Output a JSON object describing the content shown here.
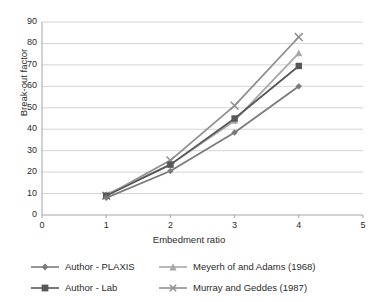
{
  "chart_data": {
    "type": "line",
    "title": "",
    "xlabel": "Embedment ratio",
    "ylabel": "Break-out factor",
    "x": [
      1,
      2,
      3,
      4
    ],
    "xlim": [
      0,
      5
    ],
    "ylim": [
      0,
      90
    ],
    "xticks": [
      "0",
      "1",
      "2",
      "3",
      "4",
      "5"
    ],
    "yticks": [
      "0",
      "10",
      "20",
      "30",
      "40",
      "50",
      "60",
      "70",
      "80",
      "90"
    ],
    "grid": "horizontal",
    "legend_position": "bottom",
    "series": [
      {
        "name": "Author - PLAXIS",
        "marker": "diamond",
        "color": "#7b7b7b",
        "values": [
          8.0,
          20.5,
          38.5,
          60.0
        ]
      },
      {
        "name": "Author - Lab",
        "marker": "square",
        "color": "#585858",
        "values": [
          9.0,
          23.5,
          45.0,
          69.5
        ]
      },
      {
        "name": "Meyerh of and Adams (1968)",
        "marker": "triangle",
        "color": "#a8a8a8",
        "values": [
          9.5,
          23.5,
          44.0,
          75.5
        ]
      },
      {
        "name": "Murray and Geddes (1987)",
        "marker": "x",
        "color": "#8f8f8f",
        "values": [
          9.0,
          25.5,
          51.0,
          83.0
        ]
      }
    ]
  },
  "style": {
    "axis_color": "#9a9a9a",
    "grid_color": "#c9c9c9",
    "text_color": "#2b2b2b",
    "background": "#ffffff"
  }
}
